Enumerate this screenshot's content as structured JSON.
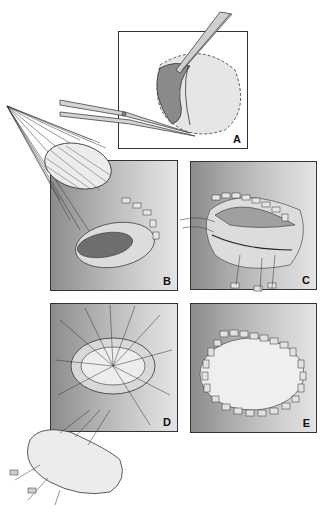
{
  "figure": {
    "panels": [
      {
        "id": "A",
        "label": "A",
        "content": "Excision with forceps and scissors of a dome-shaped tissue segment"
      },
      {
        "id": "B",
        "label": "B",
        "content": "Graft patch with radiating sutures placed over elliptical defect with pledgets"
      },
      {
        "id": "C",
        "label": "C",
        "content": "Patch lowered into defect with sutures and pledgeted row"
      },
      {
        "id": "D",
        "label": "D",
        "content": "Elliptical opening with radiating sutures; kidney-shaped patch with pledgets below"
      },
      {
        "id": "E",
        "label": "E",
        "content": "Completed ring of interrupted pledgeted sutures around opening"
      }
    ]
  },
  "colors": {
    "panel_dark": "#8c8c8c",
    "panel_light": "#e4e4e4",
    "line": "#333333",
    "tissue": "#e8e8e8"
  }
}
